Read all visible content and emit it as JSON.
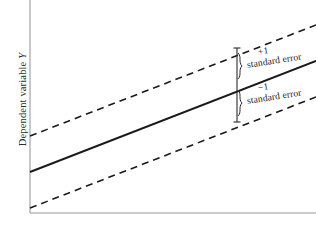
{
  "figure": {
    "background_color": "#ffffff",
    "width": 316,
    "height": 226
  },
  "axes": {
    "y_label_prefix": "Dependent variable ",
    "y_label_variable": "Y",
    "x_label": "",
    "axis_color": "#9a9a9a",
    "y_axis_x": 30,
    "x_axis_y": 213
  },
  "annotations": {
    "upper": {
      "sign": "+1",
      "text": "standard error"
    },
    "lower": {
      "sign": "−1",
      "text": "standard error"
    },
    "bracket_color": "#2a2a2a"
  },
  "chart_data": {
    "type": "line",
    "title": "",
    "xlabel": "",
    "ylabel": "Dependent variable Y",
    "grid": false,
    "legend": "none",
    "line_color": "#1a1a1a",
    "band_color": "#1a1a1a",
    "band_style": "dashed",
    "xlim": [
      0,
      316
    ],
    "ylim": [
      226,
      0
    ],
    "series": [
      {
        "name": "Regression line",
        "style": "solid",
        "x": [
          30,
          316
        ],
        "y": [
          172,
          61
        ]
      },
      {
        "name": "+1 standard error",
        "style": "dashed",
        "x": [
          30,
          316
        ],
        "y": [
          136,
          25
        ]
      },
      {
        "name": "-1 standard error",
        "style": "dashed",
        "x": [
          30,
          316
        ],
        "y": [
          208,
          97
        ]
      }
    ],
    "error_bracket": {
      "x": 237,
      "y_top": 48,
      "y_mid": 85,
      "y_bottom": 122
    }
  }
}
